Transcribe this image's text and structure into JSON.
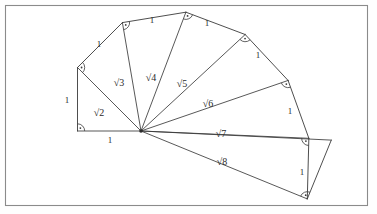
{
  "figure": {
    "name": "spiral-of-theodorus",
    "background_color": "#ffffff",
    "frame_color": "#8b8b8b",
    "line_color": "#3a3a3a",
    "text_color": "#2a2a2a",
    "hub_label": "",
    "unit_length_label": "1",
    "right_angle_count": 8
  },
  "chart_data": {
    "type": "diagram",
    "title": "",
    "xlabel": "",
    "ylabel": "",
    "hub": {
      "x": 141,
      "y": 131
    },
    "unit_px": 63.5,
    "start_angle_deg": 180,
    "hypotenuse_values": [
      {
        "n": 2,
        "label": "√2"
      },
      {
        "n": 3,
        "label": "√3"
      },
      {
        "n": 4,
        "label": "√4"
      },
      {
        "n": 5,
        "label": "√5"
      },
      {
        "n": 6,
        "label": "√6"
      },
      {
        "n": 7,
        "label": "√7"
      },
      {
        "n": 8,
        "label": "√8"
      }
    ],
    "unit_edge_labels": [
      "1",
      "1",
      "1",
      "1",
      "1",
      "1",
      "1",
      "1",
      "1"
    ],
    "spoke_lengths": [
      1,
      1.41421356,
      1.73205081,
      2,
      2.23606798,
      2.44948975,
      2.64575131,
      2.82842712
    ],
    "cumulative_angles_deg": [
      0,
      45,
      80.26438968,
      110.70481106,
      137.20354849,
      161.0332038,
      182.48913379,
      202.21162568
    ]
  },
  "labels": {
    "unit": [
      {
        "text": "1",
        "x": 67,
        "y": 103,
        "anchor": "middle",
        "name": "unit-label-left"
      },
      {
        "text": "1",
        "x": 99,
        "y": 47,
        "anchor": "middle",
        "name": "unit-label-2"
      },
      {
        "text": "1",
        "x": 152,
        "y": 23,
        "anchor": "middle",
        "name": "unit-label-3"
      },
      {
        "text": "1",
        "x": 207,
        "y": 26,
        "anchor": "middle",
        "name": "unit-label-4"
      },
      {
        "text": "1",
        "x": 258,
        "y": 58,
        "anchor": "middle",
        "name": "unit-label-5"
      },
      {
        "text": "1",
        "x": 290,
        "y": 114,
        "anchor": "middle",
        "name": "unit-label-6"
      },
      {
        "text": "1",
        "x": 302,
        "y": 175,
        "anchor": "middle",
        "name": "unit-label-7"
      },
      {
        "text": "1",
        "x": 110,
        "y": 143,
        "anchor": "middle",
        "name": "unit-label-base"
      }
    ],
    "roots": [
      {
        "text": "√2",
        "x": 99,
        "y": 116,
        "name": "root-label-2"
      },
      {
        "text": "√3",
        "x": 119,
        "y": 86,
        "name": "root-label-3"
      },
      {
        "text": "√4",
        "x": 151,
        "y": 81,
        "name": "root-label-4"
      },
      {
        "text": "√5",
        "x": 182,
        "y": 87,
        "name": "root-label-5"
      },
      {
        "text": "√6",
        "x": 208,
        "y": 107,
        "name": "root-label-6"
      },
      {
        "text": "√7",
        "x": 221,
        "y": 137,
        "name": "root-label-7"
      },
      {
        "text": "√8",
        "x": 222,
        "y": 165,
        "name": "root-label-8"
      }
    ]
  }
}
